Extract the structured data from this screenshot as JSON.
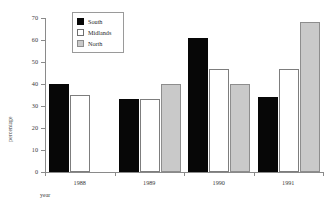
{
  "chart_data": {
    "type": "bar",
    "title": "",
    "subtitle": "",
    "xlabel": "year",
    "ylabel": "percentage",
    "categories": [
      "1988",
      "1989",
      "1990",
      "1991"
    ],
    "series": [
      {
        "name": "South",
        "color": "#070707",
        "values": [
          40,
          33,
          61,
          34
        ]
      },
      {
        "name": "Midlands",
        "color": "#ffffff",
        "values": [
          35,
          33,
          47,
          47
        ]
      },
      {
        "name": "North",
        "color": "#c9c9c9",
        "values": [
          null,
          40,
          40,
          68
        ]
      }
    ],
    "ylim": [
      0,
      70
    ],
    "ytick_step": 10,
    "yticks": [
      "70",
      "60",
      "50",
      "40",
      "30",
      "20",
      "10",
      "0"
    ],
    "grid": false,
    "legend_position": "upper-left-inside",
    "axis_color": "#8a8a8a"
  },
  "legend": {
    "items": [
      {
        "label": "South",
        "swatch": "south"
      },
      {
        "label": "Midlands",
        "swatch": "midlands"
      },
      {
        "label": "North",
        "swatch": "north"
      }
    ]
  }
}
